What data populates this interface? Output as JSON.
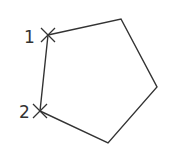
{
  "diagram": {
    "type": "pentagon",
    "stroke_color": "#333333",
    "background": "#ffffff",
    "vertices": [
      {
        "x": 48,
        "y": 35
      },
      {
        "x": 121,
        "y": 19
      },
      {
        "x": 157,
        "y": 87
      },
      {
        "x": 108,
        "y": 143
      },
      {
        "x": 40,
        "y": 111
      }
    ],
    "points": [
      {
        "label": "1",
        "x": 48,
        "y": 35,
        "marker": "x-mark"
      },
      {
        "label": "2",
        "x": 40,
        "y": 111,
        "marker": "x-mark"
      }
    ]
  }
}
